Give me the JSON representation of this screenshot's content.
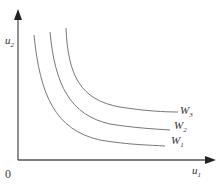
{
  "diagram": {
    "type": "indifference-curves",
    "y_axis": {
      "label": "u",
      "subscript": "2"
    },
    "x_axis": {
      "label": "u",
      "subscript": "1"
    },
    "origin_label": "0",
    "curves": [
      {
        "name": "W",
        "subscript": "1"
      },
      {
        "name": "W",
        "subscript": "2"
      },
      {
        "name": "W",
        "subscript": "3"
      }
    ],
    "colors": {
      "axis": "#555555",
      "curve": "#777777",
      "text": "#333333"
    }
  }
}
